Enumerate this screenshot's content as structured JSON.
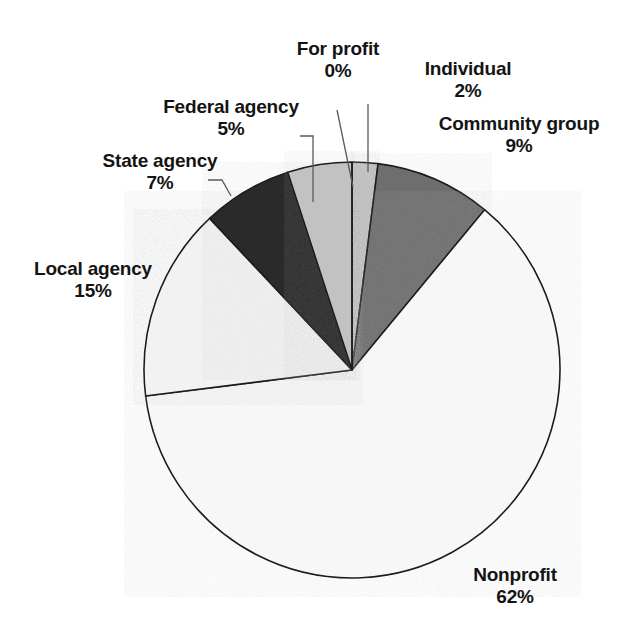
{
  "chart_data": {
    "type": "pie",
    "title": "",
    "categories": [
      "Individual",
      "Community group",
      "Nonprofit",
      "Local agency",
      "State agency",
      "Federal agency",
      "For profit"
    ],
    "values": [
      2,
      9,
      62,
      15,
      7,
      5,
      0
    ],
    "unit": "%",
    "total": 100,
    "start_angle_deg": 0,
    "direction": "clockwise",
    "legend": "none",
    "labels_position": "outside-with-leader-lines",
    "slices": [
      {
        "name": "Individual",
        "value": 2,
        "value_label": "2%",
        "color": "#c2c2c2",
        "start_pct": 0,
        "end_pct": 2
      },
      {
        "name": "Community group",
        "value": 9,
        "value_label": "9%",
        "color": "#6e6e6e",
        "start_pct": 2,
        "end_pct": 11
      },
      {
        "name": "Nonprofit",
        "value": 62,
        "value_label": "62%",
        "color": "#f7f7f7",
        "start_pct": 11,
        "end_pct": 73
      },
      {
        "name": "Local agency",
        "value": 15,
        "value_label": "15%",
        "color": "#f2f2f2",
        "start_pct": 73,
        "end_pct": 88
      },
      {
        "name": "State agency",
        "value": 7,
        "value_label": "7%",
        "color": "#2b2b2b",
        "start_pct": 88,
        "end_pct": 95
      },
      {
        "name": "Federal agency",
        "value": 5,
        "value_label": "5%",
        "color": "#c2c2c2",
        "start_pct": 95,
        "end_pct": 100
      },
      {
        "name": "For profit",
        "value": 0,
        "value_label": "0%",
        "color": "#ffffff",
        "start_pct": 100,
        "end_pct": 100
      }
    ],
    "colors": {
      "outline": "#1a1a1a",
      "leader_line": "#5a5a5a",
      "text": "#141414",
      "background": "#ffffff"
    },
    "geometry": {
      "cx": 352,
      "cy": 370,
      "r": 208
    }
  },
  "labels": {
    "for_profit": {
      "name": "For profit",
      "value": "0%"
    },
    "individual": {
      "name": "Individual",
      "value": "2%"
    },
    "community": {
      "name": "Community group",
      "value": "9%"
    },
    "federal": {
      "name": "Federal agency",
      "value": "5%"
    },
    "state": {
      "name": "State agency",
      "value": "7%"
    },
    "local": {
      "name": "Local agency",
      "value": "15%"
    },
    "nonprofit": {
      "name": "Nonprofit",
      "value": "62%"
    }
  }
}
